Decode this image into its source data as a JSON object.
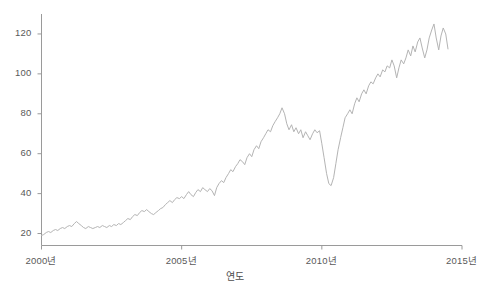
{
  "chart_data": {
    "type": "line",
    "title": "",
    "subtitle": "",
    "xlabel": "연도",
    "ylabel": "",
    "grid": false,
    "legend": "none",
    "xlim": [
      2000.0,
      2015.0
    ],
    "ylim": [
      14.0,
      130.0
    ],
    "xticks": [
      2000,
      2005,
      2010,
      2015
    ],
    "xtick_labels": [
      "2000년",
      "2005년",
      "2010년",
      "2015년"
    ],
    "yticks": [
      20,
      40,
      60,
      80,
      100,
      120
    ],
    "ytick_labels": [
      "20",
      "40",
      "60",
      "80",
      "100",
      "120"
    ],
    "line_color": "#b4b4b4",
    "axis_color": "#9a9a9a",
    "background": "#ffffff",
    "series": [
      {
        "name": "series-1",
        "x": [
          2000.0,
          2000.08,
          2000.17,
          2000.25,
          2000.33,
          2000.42,
          2000.5,
          2000.58,
          2000.67,
          2000.75,
          2000.83,
          2000.92,
          2001.0,
          2001.08,
          2001.17,
          2001.25,
          2001.33,
          2001.42,
          2001.5,
          2001.58,
          2001.67,
          2001.75,
          2001.83,
          2001.92,
          2002.0,
          2002.08,
          2002.17,
          2002.25,
          2002.33,
          2002.42,
          2002.5,
          2002.58,
          2002.67,
          2002.75,
          2002.83,
          2002.92,
          2003.0,
          2003.08,
          2003.17,
          2003.25,
          2003.33,
          2003.42,
          2003.5,
          2003.58,
          2003.67,
          2003.75,
          2003.83,
          2003.92,
          2004.0,
          2004.08,
          2004.17,
          2004.25,
          2004.33,
          2004.42,
          2004.5,
          2004.58,
          2004.67,
          2004.75,
          2004.83,
          2004.92,
          2005.0,
          2005.08,
          2005.17,
          2005.25,
          2005.33,
          2005.42,
          2005.5,
          2005.58,
          2005.67,
          2005.75,
          2005.83,
          2005.92,
          2006.0,
          2006.08,
          2006.17,
          2006.25,
          2006.33,
          2006.42,
          2006.5,
          2006.58,
          2006.67,
          2006.75,
          2006.83,
          2006.92,
          2007.0,
          2007.08,
          2007.17,
          2007.25,
          2007.33,
          2007.42,
          2007.5,
          2007.58,
          2007.67,
          2007.75,
          2007.83,
          2007.92,
          2008.0,
          2008.08,
          2008.17,
          2008.25,
          2008.33,
          2008.42,
          2008.5,
          2008.58,
          2008.67,
          2008.75,
          2008.83,
          2008.92,
          2009.0,
          2009.08,
          2009.17,
          2009.25,
          2009.33,
          2009.42,
          2009.5,
          2009.58,
          2009.67,
          2009.75,
          2009.83,
          2009.92,
          2010.0,
          2010.08,
          2010.17,
          2010.25,
          2010.33,
          2010.42,
          2010.5,
          2010.58,
          2010.67,
          2010.75,
          2010.83,
          2010.92,
          2011.0,
          2011.08,
          2011.17,
          2011.25,
          2011.33,
          2011.42,
          2011.5,
          2011.58,
          2011.67,
          2011.75,
          2011.83,
          2011.92,
          2012.0,
          2012.08,
          2012.17,
          2012.25,
          2012.33,
          2012.42,
          2012.5,
          2012.58,
          2012.67,
          2012.75,
          2012.83,
          2012.92,
          2013.0,
          2013.08,
          2013.17,
          2013.25,
          2013.33,
          2013.42,
          2013.5,
          2013.58,
          2013.67,
          2013.75,
          2013.83,
          2013.92,
          2014.0,
          2014.08,
          2014.17,
          2014.25,
          2014.33,
          2014.42,
          2014.5
        ],
        "y": [
          19.0,
          19.5,
          20.5,
          21.0,
          20.5,
          21.5,
          22.0,
          21.5,
          22.5,
          23.0,
          22.5,
          23.5,
          24.0,
          23.5,
          25.0,
          26.0,
          25.0,
          24.0,
          23.0,
          22.5,
          23.5,
          23.0,
          22.5,
          23.0,
          23.5,
          23.0,
          24.0,
          23.5,
          23.0,
          24.0,
          23.5,
          24.5,
          24.0,
          25.0,
          24.5,
          25.5,
          26.5,
          27.5,
          27.0,
          28.5,
          29.5,
          29.0,
          30.5,
          31.5,
          31.0,
          32.0,
          31.0,
          30.0,
          29.5,
          30.5,
          31.5,
          32.5,
          33.0,
          34.5,
          35.5,
          36.5,
          35.5,
          37.0,
          38.0,
          37.5,
          38.5,
          37.5,
          39.5,
          41.0,
          39.5,
          38.5,
          40.5,
          42.0,
          41.0,
          43.0,
          42.0,
          41.0,
          42.5,
          41.5,
          39.0,
          43.0,
          45.0,
          46.5,
          45.5,
          48.0,
          50.0,
          52.0,
          51.0,
          53.5,
          55.0,
          57.0,
          56.0,
          54.5,
          58.0,
          60.0,
          58.5,
          62.0,
          64.0,
          62.5,
          66.0,
          68.0,
          70.0,
          72.0,
          71.0,
          74.0,
          76.0,
          78.0,
          80.0,
          83.0,
          80.0,
          75.0,
          72.0,
          74.5,
          71.0,
          73.0,
          70.0,
          72.0,
          68.0,
          71.0,
          69.0,
          67.0,
          70.0,
          72.0,
          70.5,
          71.5,
          65.0,
          58.0,
          50.0,
          45.0,
          44.0,
          48.0,
          55.0,
          62.0,
          68.0,
          73.0,
          78.0,
          80.0,
          82.0,
          80.0,
          85.0,
          88.0,
          86.0,
          90.0,
          92.0,
          90.0,
          94.0,
          96.0,
          95.0,
          98.0,
          100.0,
          98.5,
          102.0,
          101.0,
          104.0,
          103.0,
          107.0,
          104.0,
          98.0,
          103.0,
          107.0,
          105.0,
          108.0,
          112.0,
          109.0,
          114.0,
          111.0,
          116.0,
          118.0,
          113.0,
          108.0,
          112.0,
          118.0,
          122.0,
          125.0,
          118.0,
          112.0,
          119.0,
          123.0,
          120.0,
          112.5
        ]
      }
    ]
  },
  "axes": {
    "x_title": "연도",
    "y_title": ""
  }
}
